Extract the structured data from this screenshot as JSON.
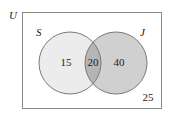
{
  "diagram": {
    "type": "venn",
    "universe_label": "U",
    "sets": [
      {
        "label": "S",
        "only_value": "15",
        "fill": "#ececec"
      },
      {
        "label": "J",
        "only_value": "40",
        "fill": "#d0d0d0"
      }
    ],
    "intersection": {
      "value": "20",
      "fill": "#b5b5b5"
    },
    "outside_value": "25",
    "colors": {
      "outline": "#7a7a7a",
      "border": "#8a8a8a",
      "background": "#ffffff"
    }
  }
}
